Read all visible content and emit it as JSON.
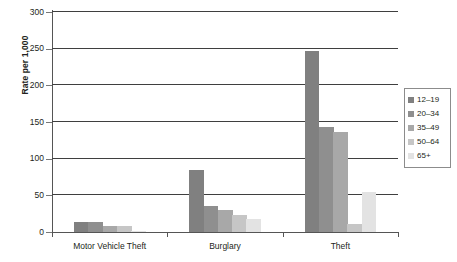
{
  "chart_data": {
    "type": "bar",
    "title": "",
    "xlabel": "",
    "ylabel": "Rate per 1,000",
    "categories": [
      "Motor Vehicle Theft",
      "Burglary",
      "Theft"
    ],
    "series": [
      {
        "name": "12–19",
        "color": "#808080",
        "values": [
          14,
          84,
          247
        ]
      },
      {
        "name": "20–34",
        "color": "#8f8f8f",
        "values": [
          14,
          36,
          143
        ]
      },
      {
        "name": "35–49",
        "color": "#a8a8a8",
        "values": [
          8,
          30,
          137
        ]
      },
      {
        "name": "50–64",
        "color": "#c6c6c6",
        "values": [
          8,
          23,
          11
        ]
      },
      {
        "name": "65+",
        "color": "#e3e3e3",
        "values": [
          2,
          18,
          55
        ]
      }
    ],
    "ylim": [
      0,
      300
    ],
    "yticks": [
      0,
      50,
      100,
      150,
      200,
      250,
      300
    ],
    "ytick_labels": [
      "0",
      "50",
      "100",
      "150",
      "200",
      "250",
      "300"
    ],
    "grid": true,
    "legend_position": "right"
  }
}
